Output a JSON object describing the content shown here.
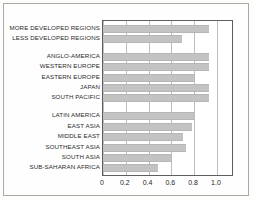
{
  "chart_data": {
    "type": "bar",
    "orientation": "horizontal",
    "title": "",
    "subtitle": "",
    "xlabel": "",
    "ylabel": "",
    "xlim": [
      0,
      1.15
    ],
    "xticks": [
      "0",
      "0.2",
      "0.4",
      "0.6",
      "0.8",
      "1.0"
    ],
    "xtick_values": [
      0,
      0.2,
      0.4,
      0.6,
      0.8,
      1.0
    ],
    "grid": "vertical",
    "legend": "none",
    "bar_color": "#c3c3c3",
    "axis_color": "#5e5e5e",
    "grid_color": "#bdbdbd",
    "groups": [
      {
        "name": "development-groups",
        "categories": [
          "MORE DEVELOPED REGIONS",
          "LESS DEVELOPED REGIONS"
        ],
        "values": [
          0.93,
          0.69
        ]
      },
      {
        "name": "developed-regions",
        "categories": [
          "ANGLO-AMERICA",
          "WESTERN EUROPE",
          "EASTERN EUROPE",
          "JAPAN",
          "SOUTH PACIFIC"
        ],
        "values": [
          0.93,
          0.93,
          0.8,
          0.93,
          0.93
        ]
      },
      {
        "name": "developing-regions",
        "categories": [
          "LATIN AMERICA",
          "EAST ASIA",
          "MIDDLE EAST",
          "SOUTHEAST ASIA",
          "SOUTH ASIA",
          "SUB-SAHARAN AFRICA"
        ],
        "values": [
          0.8,
          0.785,
          0.7,
          0.73,
          0.6,
          0.485
        ]
      }
    ],
    "categories": [
      "MORE DEVELOPED REGIONS",
      "LESS DEVELOPED REGIONS",
      "ANGLO-AMERICA",
      "WESTERN EUROPE",
      "EASTERN EUROPE",
      "JAPAN",
      "SOUTH PACIFIC",
      "LATIN AMERICA",
      "EAST ASIA",
      "MIDDLE EAST",
      "SOUTHEAST ASIA",
      "SOUTH ASIA",
      "SUB-SAHARAN AFRICA"
    ],
    "values": [
      0.93,
      0.69,
      0.93,
      0.93,
      0.8,
      0.93,
      0.93,
      0.8,
      0.785,
      0.7,
      0.73,
      0.6,
      0.485
    ]
  }
}
